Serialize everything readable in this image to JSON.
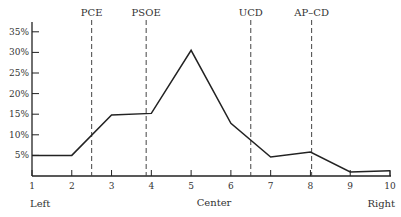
{
  "chart_data": {
    "type": "line",
    "title": "",
    "xlabel": "",
    "ylabel": "",
    "x": [
      1,
      2,
      3,
      4,
      5,
      6,
      7,
      8,
      9,
      10
    ],
    "series": [
      {
        "name": "Distribution",
        "values": [
          5.0,
          5.0,
          14.8,
          15.2,
          30.5,
          12.8,
          4.6,
          5.8,
          1.0,
          1.3
        ]
      }
    ],
    "xlim": [
      1,
      10
    ],
    "ylim": [
      0,
      35
    ],
    "y_ticks": [
      5,
      10,
      15,
      20,
      25,
      30,
      35
    ],
    "y_tick_labels": [
      "5%",
      "10%",
      "15%",
      "20%",
      "25%",
      "30%",
      "35%"
    ],
    "x_ticks": [
      1,
      2,
      3,
      4,
      5,
      6,
      7,
      8,
      9,
      10
    ],
    "x_tick_labels": [
      "1",
      "2",
      "3",
      "4",
      "5",
      "6",
      "7",
      "8",
      "9",
      "10"
    ],
    "axis_captions": {
      "left": "Left",
      "center": "Center",
      "right": "Right"
    },
    "annotations": [
      {
        "label": "PCE",
        "x": 2.5
      },
      {
        "label": "PSOE",
        "x": 3.87
      },
      {
        "label": "UCD",
        "x": 6.5
      },
      {
        "label": "AP–CD",
        "x": 8.03
      }
    ],
    "grid": false,
    "legend": "none"
  }
}
